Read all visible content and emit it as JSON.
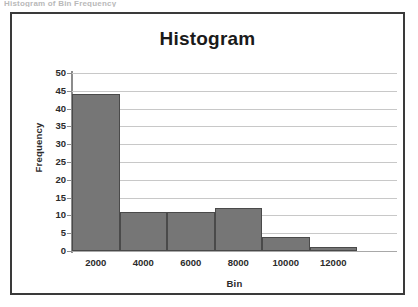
{
  "scan_artifact_text": "Histogram of Bin Frequency",
  "chart_data": {
    "type": "bar",
    "title": "Histogram",
    "xlabel": "Bin",
    "ylabel": "Frequency",
    "categories": [
      "2000",
      "4000",
      "6000",
      "8000",
      "10000",
      "12000"
    ],
    "values": [
      44,
      11,
      11,
      12,
      4,
      1
    ],
    "ylim": [
      0,
      50
    ],
    "ytick_labels": [
      "0",
      "5",
      "10",
      "15",
      "20",
      "25",
      "30",
      "35",
      "40",
      "45",
      "50"
    ],
    "ytick_values": [
      0,
      5,
      10,
      15,
      20,
      25,
      30,
      35,
      40,
      45,
      50
    ],
    "xtick_labels": [
      "2000",
      "4000",
      "6000",
      "8000",
      "10000",
      "12000"
    ],
    "grid": true,
    "legend": false,
    "bar_color": "#767676",
    "bar_border_color": "#4a4a4a",
    "gridline_color": "#c8c8c8",
    "frame_color": "#3a3a3a",
    "text_color": "#2b2b2b"
  }
}
